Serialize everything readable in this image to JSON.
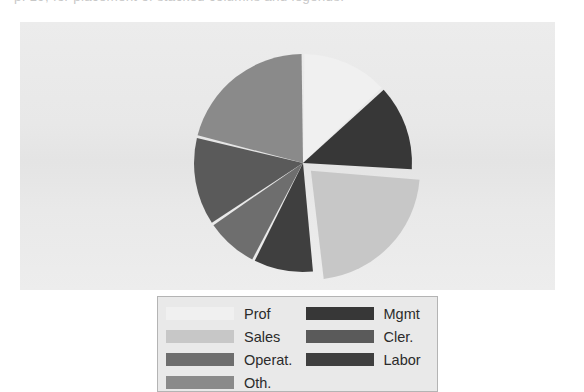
{
  "page": {
    "width": 584,
    "height": 381,
    "background": "#ffffff",
    "panel_background": "#e9e9e9",
    "clipped_top_text": "p. 19, for placement of stacked columns and legends."
  },
  "legend": {
    "border_color": "#b4b4b4",
    "background": "#e9e9e9",
    "columns": 2,
    "rows": 4,
    "entries": [
      {
        "label": "Prof",
        "color": "#f0f0f0",
        "clipped": false
      },
      {
        "label": "Mgmt",
        "color": "#373737",
        "clipped": false
      },
      {
        "label": "Sales",
        "color": "#c7c7c7",
        "clipped": false
      },
      {
        "label": "Cler.",
        "color": "#5a5a5a",
        "clipped": false
      },
      {
        "label": "Operat.",
        "color": "#6e6e6e",
        "clipped": false
      },
      {
        "label": "Labor",
        "color": "#3f3f3f",
        "clipped": false
      },
      {
        "label": "Oth.",
        "color": "#8a8a8a",
        "clipped": true
      },
      {
        "label": "",
        "color": "#e9e9e9",
        "clipped": true
      }
    ]
  },
  "chart_data": {
    "type": "pie",
    "title": "",
    "subtitle": "",
    "xlabel": "",
    "ylabel": "",
    "grid": false,
    "legend_position": "bottom",
    "center": {
      "x": 303,
      "y": 163
    },
    "radius": 109,
    "start_angle_deg": 0,
    "direction": "clockwise",
    "exploded_slice": "Sales",
    "explode_offset_px": 11,
    "slice_gap_deg": 1.5,
    "categories": [
      "Prof",
      "Mgmt",
      "Sales",
      "Labor",
      "Operat.",
      "Cler.",
      "Oth."
    ],
    "values": [
      13,
      13,
      22,
      9,
      8,
      13,
      22
    ],
    "unit": "percent",
    "slices": [
      {
        "label": "Prof",
        "value": 13,
        "start_deg": 0,
        "end_deg": 47,
        "color": "#f0f0f0",
        "exploded": false
      },
      {
        "label": "Mgmt",
        "value": 13,
        "start_deg": 47,
        "end_deg": 94,
        "color": "#373737",
        "exploded": false
      },
      {
        "label": "Sales",
        "value": 22,
        "start_deg": 94,
        "end_deg": 174,
        "color": "#c7c7c7",
        "exploded": true
      },
      {
        "label": "Labor",
        "value": 9,
        "start_deg": 174,
        "end_deg": 207,
        "color": "#3f3f3f",
        "exploded": false
      },
      {
        "label": "Operat.",
        "value": 8,
        "start_deg": 207,
        "end_deg": 236,
        "color": "#6e6e6e",
        "exploded": false
      },
      {
        "label": "Cler.",
        "value": 13,
        "start_deg": 236,
        "end_deg": 284,
        "color": "#5a5a5a",
        "exploded": false
      },
      {
        "label": "Oth.",
        "value": 22,
        "start_deg": 284,
        "end_deg": 360,
        "color": "#8a8a8a",
        "exploded": false
      }
    ]
  }
}
